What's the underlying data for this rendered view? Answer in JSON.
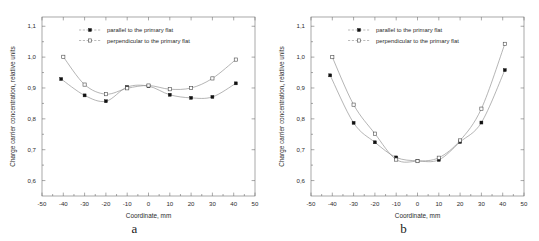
{
  "figure": {
    "panels": [
      {
        "caption": "a",
        "chart_data": {
          "type": "line",
          "title": "",
          "xlabel": "Coordinate, mm",
          "ylabel": "Charge carrier concentration, relative units",
          "xlim": [
            -50,
            50
          ],
          "ylim": [
            0.55,
            1.13
          ],
          "xticks": [
            -50,
            -40,
            -30,
            -20,
            -10,
            0,
            10,
            20,
            30,
            40,
            50
          ],
          "xticklabels": [
            "-50",
            "-40",
            "-30",
            "-20",
            "-10",
            "0",
            "10",
            "20",
            "30",
            "40",
            "50"
          ],
          "yticks": [
            0.6,
            0.7,
            0.8,
            0.9,
            1.0,
            1.1
          ],
          "yticklabels": [
            "0,6",
            "0,7",
            "0,8",
            "0,9",
            "1,0",
            "1,1"
          ],
          "grid": false,
          "legend_position": "upper center",
          "series": [
            {
              "name": "parallel to the primary flat",
              "marker": "filled-square",
              "x": [
                -41,
                -30,
                -20,
                -10,
                0,
                10,
                20,
                30,
                41
              ],
              "values": [
                0.929,
                0.876,
                0.857,
                0.903,
                0.906,
                0.878,
                0.868,
                0.871,
                0.915
              ]
            },
            {
              "name": "perpendicular to the primary flat",
              "marker": "open-square",
              "x": [
                -40,
                -30,
                -20,
                -10,
                0,
                10,
                20,
                30,
                41
              ],
              "values": [
                1.001,
                0.911,
                0.88,
                0.899,
                0.908,
                0.896,
                0.9,
                0.931,
                0.992
              ]
            }
          ]
        }
      },
      {
        "caption": "b",
        "chart_data": {
          "type": "line",
          "title": "",
          "xlabel": "Coordinate, mm",
          "ylabel": "Charge carrier concentration, relative units",
          "xlim": [
            -50,
            50
          ],
          "ylim": [
            0.55,
            1.13
          ],
          "xticks": [
            -50,
            -40,
            -30,
            -20,
            -10,
            0,
            10,
            20,
            30,
            40,
            50
          ],
          "xticklabels": [
            "-50",
            "-40",
            "-30",
            "-20",
            "-10",
            "0",
            "10",
            "20",
            "30",
            "40",
            "50"
          ],
          "yticks": [
            0.6,
            0.7,
            0.8,
            0.9,
            1.0,
            1.1
          ],
          "yticklabels": [
            "0,6",
            "0,7",
            "0,8",
            "0,9",
            "1,0",
            "1,1"
          ],
          "grid": false,
          "legend_position": "upper center",
          "series": [
            {
              "name": "parallel to the primary flat",
              "marker": "filled-square",
              "x": [
                -41,
                -30,
                -20,
                -10,
                0,
                10,
                20,
                30,
                41
              ],
              "values": [
                0.941,
                0.787,
                0.724,
                0.675,
                0.664,
                0.667,
                0.725,
                0.788,
                0.958
              ]
            },
            {
              "name": "perpendicular to the primary flat",
              "marker": "open-square",
              "x": [
                -40,
                -30,
                -20,
                -10,
                0,
                10,
                20,
                30,
                41
              ],
              "values": [
                1.0,
                0.846,
                0.752,
                0.668,
                0.663,
                0.674,
                0.73,
                0.833,
                1.043
              ]
            }
          ]
        }
      }
    ]
  }
}
